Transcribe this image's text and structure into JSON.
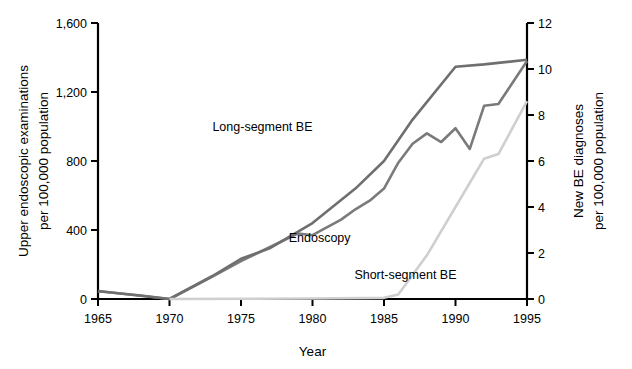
{
  "chart_data": {
    "type": "line",
    "title": "",
    "xlabel": "Year",
    "ylabel": "Upper endoscopic examinations per 100,000 population",
    "ylabel_right": "New BE diagnoses per 100,000 population",
    "xlim": [
      1965,
      1995
    ],
    "ylim": [
      0,
      1600
    ],
    "ylim_right": [
      0,
      12
    ],
    "xticks": [
      "1965",
      "1970",
      "1975",
      "1980",
      "1985",
      "1990",
      "1995"
    ],
    "xtick_values": [
      1965,
      1970,
      1975,
      1980,
      1985,
      1990,
      1995
    ],
    "yticks": [
      "0",
      "400",
      "800",
      "1,200",
      "1,600"
    ],
    "ytick_values": [
      0,
      400,
      800,
      1200,
      1600
    ],
    "yticks_right": [
      "0",
      "2",
      "4",
      "6",
      "8",
      "10",
      "12"
    ],
    "ytick_values_right": [
      0,
      2,
      4,
      6,
      8,
      10,
      12
    ],
    "grid": false,
    "legend_position": "inline-annotations",
    "series": [
      {
        "name": "Endoscopy",
        "axis": "left",
        "color": "#7a7a7a",
        "width": 2.6,
        "label_x": 1980.5,
        "label_y": 330,
        "x": [
          1965,
          1968,
          1970,
          1973,
          1975,
          1977,
          1979,
          1980,
          1982,
          1983,
          1984,
          1985,
          1986,
          1987,
          1988,
          1989,
          1990,
          1991,
          1992,
          1993,
          1995
        ],
        "values": [
          45,
          20,
          0,
          130,
          220,
          300,
          380,
          370,
          460,
          520,
          570,
          640,
          790,
          900,
          960,
          910,
          990,
          870,
          1120,
          1130,
          1380
        ]
      },
      {
        "name": "Long-segment BE",
        "axis": "right",
        "color": "#6f6f6f",
        "width": 2.6,
        "label_x": 1976.5,
        "label_y": 7.3,
        "x": [
          1965,
          1970,
          1973,
          1975,
          1977,
          1980,
          1983,
          1985,
          1987,
          1990,
          1992,
          1995
        ],
        "values": [
          0.35,
          0.0,
          1.0,
          1.75,
          2.2,
          3.3,
          4.8,
          6.0,
          7.8,
          10.1,
          10.2,
          10.4
        ]
      },
      {
        "name": "Short-segment BE",
        "axis": "right",
        "color": "#cfcfcf",
        "width": 2.6,
        "label_x": 1986.5,
        "label_y": 0.85,
        "x": [
          1970,
          1980,
          1985,
          1986,
          1988,
          1990,
          1992,
          1993,
          1995
        ],
        "values": [
          0.0,
          0.02,
          0.05,
          0.2,
          1.9,
          4.0,
          6.1,
          6.3,
          8.6
        ]
      }
    ]
  },
  "axes": {
    "left_title_line1": "Upper endoscopic examinations",
    "left_title_line2": "per 100,000 population",
    "right_title_line1": "New BE diagnoses",
    "right_title_line2": "per 100,000 population",
    "x_title": "Year"
  }
}
